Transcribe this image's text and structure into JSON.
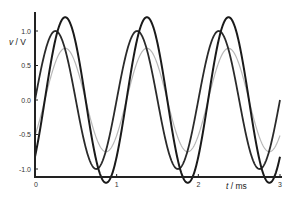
{
  "chart_data": {
    "type": "line",
    "title": "",
    "xlabel_var": "t",
    "xlabel_unit": " / ms",
    "ylabel_var": "v",
    "ylabel_unit": " / V",
    "xlim": [
      0,
      3
    ],
    "ylim": [
      -1.2,
      1.2
    ],
    "x_ticks": [
      0,
      1,
      2,
      3
    ],
    "x_tick_labels": [
      "0",
      "1",
      "2",
      "3"
    ],
    "y_ticks": [
      1.0,
      0.5,
      0.0,
      -0.5,
      -1.0
    ],
    "y_tick_labels": [
      "1.0",
      "0.5",
      "0.0",
      "-0.5",
      "-1.0"
    ],
    "grid": false,
    "legend": null,
    "series": [
      {
        "name": "wave A (amplitude 1.2)",
        "function": "sine",
        "amplitude": 1.2,
        "frequency_khz": 1.0,
        "peak_time_ms": 0.37,
        "color": "#1a1a1a",
        "width": 2.0
      },
      {
        "name": "wave B (amplitude 1.0)",
        "function": "sine",
        "amplitude": 1.0,
        "frequency_khz": 1.0,
        "peak_time_ms": 0.25,
        "color": "#2a2a2a",
        "width": 1.8
      },
      {
        "name": "wave C (amplitude 0.75)",
        "function": "sine",
        "amplitude": 0.75,
        "frequency_khz": 1.0,
        "peak_time_ms": 0.37,
        "color": "#b8b8b8",
        "width": 1.2
      }
    ]
  }
}
